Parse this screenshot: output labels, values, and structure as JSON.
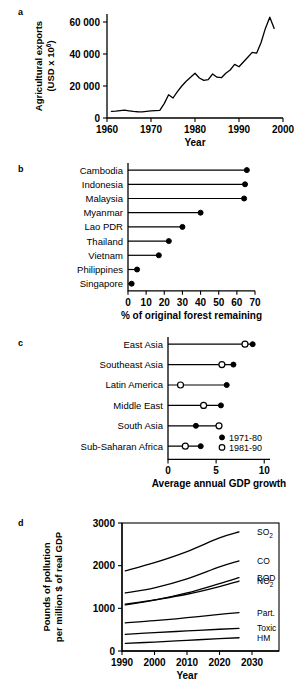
{
  "figure": {
    "panel_letters": {
      "a": "a",
      "b": "b",
      "c": "c",
      "d": "d"
    }
  },
  "chart_data": [
    {
      "id": "panel-a",
      "type": "line",
      "title": "",
      "xlabel": "Year",
      "ylabel": "Agricultural exports (USD x 10⁶)",
      "ylabel_line1": "Agricultural exports",
      "ylabel_line2": "(USD x 10",
      "ylabel_line2_sup": "6",
      "ylabel_line2_end": ")",
      "xlim": [
        1960,
        2000
      ],
      "ylim": [
        0,
        65000
      ],
      "xticks": [
        1960,
        1970,
        1980,
        1990,
        2000
      ],
      "xtick_labels": [
        "1960",
        "1970",
        "1980",
        "1990",
        "2000"
      ],
      "yticks": [
        0,
        20000,
        40000,
        60000
      ],
      "ytick_labels": [
        "0",
        "20 000",
        "40 000",
        "60 000"
      ],
      "grid": false,
      "series": [
        {
          "name": "Agricultural exports",
          "x": [
            1961,
            1962,
            1963,
            1964,
            1965,
            1966,
            1967,
            1968,
            1969,
            1970,
            1971,
            1972,
            1973,
            1974,
            1975,
            1976,
            1977,
            1978,
            1979,
            1980,
            1981,
            1982,
            1983,
            1984,
            1985,
            1986,
            1987,
            1988,
            1989,
            1990,
            1991,
            1992,
            1993,
            1994,
            1995,
            1996,
            1997,
            1998
          ],
          "y": [
            4200,
            4300,
            4600,
            4900,
            4500,
            4100,
            3900,
            3800,
            4100,
            4400,
            4600,
            4800,
            9000,
            14500,
            12500,
            16500,
            20000,
            23000,
            25500,
            28000,
            25000,
            23500,
            24000,
            27500,
            25500,
            25200,
            28000,
            30000,
            33500,
            32000,
            35000,
            38000,
            41000,
            40500,
            47000,
            56000,
            63000,
            56000
          ]
        }
      ]
    },
    {
      "id": "panel-b",
      "type": "bar",
      "subtype": "lollipop-horizontal",
      "title": "",
      "xlabel": "% of original forest remaining",
      "ylabel": "",
      "xlim": [
        0,
        70
      ],
      "xticks": [
        0,
        10,
        20,
        30,
        40,
        50,
        60,
        70
      ],
      "xtick_labels": [
        "0",
        "10",
        "20",
        "30",
        "40",
        "50",
        "60",
        "70"
      ],
      "grid": false,
      "categories": [
        "Cambodia",
        "Indonesia",
        "Malaysia",
        "Myanmar",
        "Lao PDR",
        "Thailand",
        "Vietnam",
        "Philippines",
        "Singapore"
      ],
      "values": [
        65.5,
        64.5,
        64.0,
        40.0,
        30.0,
        22.5,
        17.0,
        5.0,
        2.0
      ],
      "marker": "filled-circle"
    },
    {
      "id": "panel-c",
      "type": "scatter",
      "subtype": "dumbbell-horizontal",
      "title": "",
      "xlabel": "Average annual GDP growth",
      "ylabel": "",
      "xlim": [
        0,
        10.6
      ],
      "xticks": [
        0,
        5,
        10
      ],
      "xtick_labels": [
        "0",
        "5",
        "10"
      ],
      "grid": false,
      "categories": [
        "East Asia",
        "Southeast Asia",
        "Latin America",
        "Middle East",
        "South Asia",
        "Sub-Saharan Africa"
      ],
      "legend_position": "bottom-right",
      "series": [
        {
          "name": "1971-80",
          "marker": "filled-circle",
          "values": [
            8.8,
            6.8,
            6.1,
            5.5,
            2.9,
            3.4
          ]
        },
        {
          "name": "1981-90",
          "marker": "open-circle",
          "values": [
            8.0,
            5.6,
            1.3,
            3.7,
            5.3,
            1.8
          ]
        }
      ]
    },
    {
      "id": "panel-d",
      "type": "line",
      "title": "",
      "xlabel": "Year",
      "ylabel": "Pounds of pollution per million $ of real GDP",
      "ylabel_line1": "Pounds of pollution",
      "ylabel_line2": "per million $ of real GDP",
      "xlim": [
        1990,
        2030
      ],
      "ylim": [
        0,
        3000
      ],
      "xticks": [
        1990,
        2000,
        2010,
        2020,
        2030
      ],
      "xtick_labels": [
        "1990",
        "2000",
        "2010",
        "2020",
        "2030"
      ],
      "yticks": [
        0,
        1000,
        2000,
        3000
      ],
      "ytick_labels": [
        "0",
        "1000",
        "2000",
        "3000"
      ],
      "grid": false,
      "series": [
        {
          "name": "SO2",
          "label": "SO",
          "label_sub": "2",
          "x": [
            1991,
            2000,
            2010,
            2020,
            2026
          ],
          "y": [
            1880,
            2070,
            2330,
            2650,
            2790
          ]
        },
        {
          "name": "CO",
          "label": "CO",
          "label_sub": "",
          "x": [
            1991,
            2000,
            2010,
            2020,
            2026
          ],
          "y": [
            1360,
            1480,
            1690,
            1970,
            2110
          ]
        },
        {
          "name": "BOD",
          "label": "BOD",
          "label_sub": "",
          "x": [
            1991,
            2000,
            2010,
            2020,
            2026
          ],
          "y": [
            1080,
            1190,
            1360,
            1580,
            1720
          ]
        },
        {
          "name": "NO2",
          "label": "NO",
          "label_sub": "2",
          "x": [
            1991,
            2000,
            2010,
            2020,
            2026
          ],
          "y": [
            1100,
            1200,
            1330,
            1510,
            1640
          ]
        },
        {
          "name": "Part.",
          "label": "Part.",
          "label_sub": "",
          "x": [
            1991,
            2000,
            2010,
            2020,
            2026
          ],
          "y": [
            660,
            710,
            780,
            860,
            900
          ]
        },
        {
          "name": "Toxic",
          "label": "Toxic",
          "label_sub": "",
          "x": [
            1991,
            2000,
            2010,
            2020,
            2026
          ],
          "y": [
            390,
            430,
            470,
            510,
            530
          ]
        },
        {
          "name": "HM",
          "label": "HM",
          "label_sub": "",
          "x": [
            1991,
            2000,
            2010,
            2020,
            2026
          ],
          "y": [
            180,
            210,
            250,
            290,
            310
          ]
        }
      ]
    }
  ]
}
